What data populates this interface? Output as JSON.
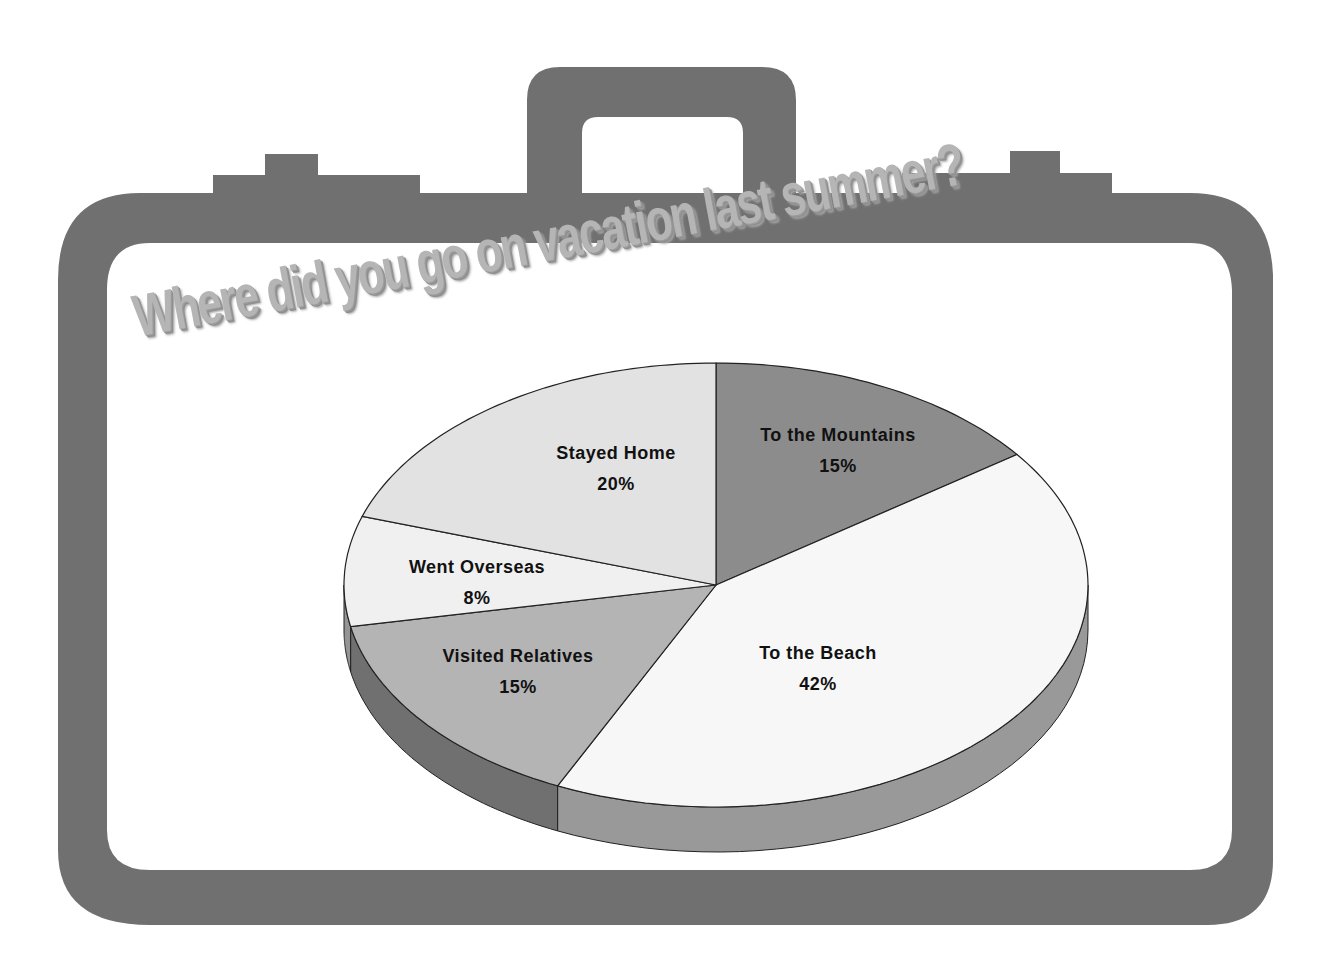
{
  "chart_data": {
    "type": "pie",
    "title": "Where did you go on vacation last summer?",
    "style": "3d-pie",
    "start_angle": "12 o'clock",
    "direction": "clockwise",
    "slices": [
      {
        "label": "To  the Mountains",
        "value": 15,
        "display": "15%",
        "color": "#8c8c8c"
      },
      {
        "label": "To the Beach",
        "value": 42,
        "display": "42%",
        "color": "#f7f7f7"
      },
      {
        "label": "Visited Relatives",
        "value": 15,
        "display": "15%",
        "color": "#b4b4b4"
      },
      {
        "label": "Went Overseas",
        "value": 8,
        "display": "8%",
        "color": "#f0f0f0"
      },
      {
        "label": "Stayed Home",
        "value": 20,
        "display": "20%",
        "color": "#e2e2e2"
      }
    ],
    "categories": [
      "To  the Mountains",
      "To the Beach",
      "Visited Relatives",
      "Went Overseas",
      "Stayed Home"
    ],
    "values": [
      15,
      42,
      15,
      8,
      20
    ],
    "unit": "%",
    "legend": "none (data labels on slices)"
  },
  "decoration": {
    "frame": "suitcase-outline",
    "frame_color": "#707070"
  },
  "labels": {
    "title": "Where did you go on vacation last summer?",
    "s0_name": "To  the Mountains",
    "s0_pct": "15%",
    "s1_name": "To the Beach",
    "s1_pct": "42%",
    "s2_name": "Visited Relatives",
    "s2_pct": "15%",
    "s3_name": "Went Overseas",
    "s3_pct": "8%",
    "s4_name": "Stayed Home",
    "s4_pct": "20%"
  }
}
